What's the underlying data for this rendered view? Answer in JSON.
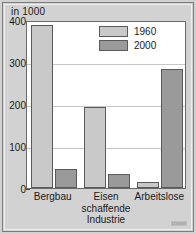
{
  "chart_data": {
    "type": "bar",
    "title": "",
    "subtitle": "",
    "unit_label": "in 1000",
    "xlabel": "",
    "ylabel": "",
    "categories": [
      "Bergbau",
      "Eisen schaffende Industrie",
      "Arbeitslose"
    ],
    "category_lines": [
      [
        "Bergbau"
      ],
      [
        "Eisen",
        "schaffende",
        "Industrie"
      ],
      [
        "Arbeitslose"
      ]
    ],
    "series": [
      {
        "name": "1960",
        "color": "#c9c9c9",
        "values": [
          388,
          193,
          15
        ]
      },
      {
        "name": "2000",
        "color": "#9a9a9a",
        "values": [
          46,
          34,
          283
        ]
      }
    ],
    "ylim": [
      0,
      400
    ],
    "yticks": [
      0,
      100,
      200,
      300,
      400
    ],
    "ytick_labels": [
      "0",
      "100",
      "200",
      "300",
      "400"
    ],
    "grid": true,
    "legend_position": "top-right",
    "legend_entries": [
      "1960",
      "2000"
    ]
  },
  "credit": "IZ/BBE"
}
